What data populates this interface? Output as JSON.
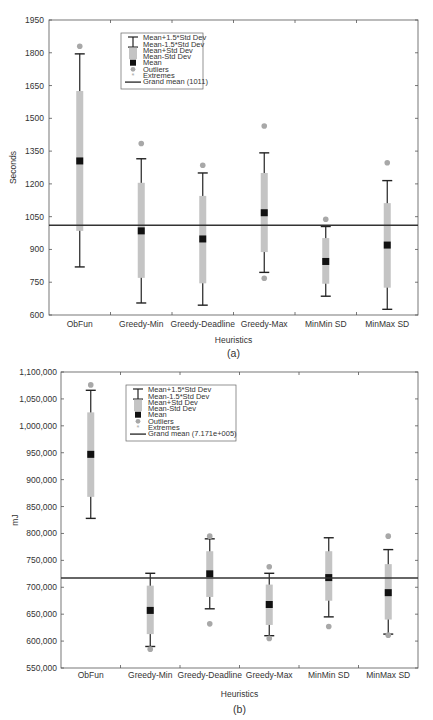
{
  "chart_data": [
    {
      "type": "box",
      "caption": "(a)",
      "xlabel": "Heuristics",
      "ylabel": "Seconds",
      "ylim": [
        600,
        1950
      ],
      "yticks": [
        600,
        750,
        900,
        1050,
        1200,
        1350,
        1500,
        1650,
        1800,
        1950
      ],
      "ytick_labels": [
        "600",
        "750",
        "900",
        "1050",
        "1200",
        "1350",
        "1500",
        "1650",
        "1800",
        "1950"
      ],
      "categories": [
        "ObFun",
        "Greedy-Min",
        "Greedy-Deadline",
        "Greedy-Max",
        "MinMin SD",
        "MinMax SD"
      ],
      "grand_mean": 1011,
      "series": [
        {
          "name": "ObFun",
          "mean": 1305,
          "box_low": 985,
          "box_high": 1625,
          "whisker_low": 820,
          "whisker_high": 1795,
          "outliers": [
            1830
          ]
        },
        {
          "name": "Greedy-Min",
          "mean": 985,
          "box_low": 770,
          "box_high": 1205,
          "whisker_low": 655,
          "whisker_high": 1315,
          "outliers": [
            1385
          ]
        },
        {
          "name": "Greedy-Deadline",
          "mean": 948,
          "box_low": 745,
          "box_high": 1145,
          "whisker_low": 645,
          "whisker_high": 1250,
          "outliers": [
            1285
          ]
        },
        {
          "name": "Greedy-Max",
          "mean": 1068,
          "box_low": 888,
          "box_high": 1250,
          "whisker_low": 795,
          "whisker_high": 1342,
          "outliers": [
            1465,
            768
          ]
        },
        {
          "name": "MinMin SD",
          "mean": 845,
          "box_low": 743,
          "box_high": 952,
          "whisker_low": 686,
          "whisker_high": 1005,
          "outliers": [
            1038
          ]
        },
        {
          "name": "MinMax SD",
          "mean": 920,
          "box_low": 725,
          "box_high": 1112,
          "whisker_low": 626,
          "whisker_high": 1215,
          "outliers": [
            1297
          ]
        }
      ],
      "legend": {
        "position": "upper center",
        "entries": [
          "Mean+1.5*Std Dev",
          "Mean-1.5*Std Dev",
          "Mean+Std Dev",
          "Mean-Std Dev",
          "Mean",
          "Outliers",
          "Extremes",
          "Grand mean (1011)"
        ]
      },
      "grid": false
    },
    {
      "type": "box",
      "caption": "(b)",
      "xlabel": "Heuristics",
      "ylabel": "mJ",
      "ylim": [
        550000,
        1100000
      ],
      "yticks": [
        550000,
        600000,
        650000,
        700000,
        750000,
        800000,
        850000,
        900000,
        950000,
        1000000,
        1050000,
        1100000
      ],
      "ytick_labels": [
        "550,000",
        "600,000",
        "650,000",
        "700,000",
        "750,000",
        "800,000",
        "850,000",
        "900,000",
        "950,000",
        "1,000,000",
        "1,050,000",
        "1,100,000"
      ],
      "categories": [
        "ObFun",
        "Greedy-Min",
        "Greedy-Deadline",
        "Greedy-Max",
        "MinMin SD",
        "MinMax SD"
      ],
      "grand_mean": 717100,
      "series": [
        {
          "name": "ObFun",
          "mean": 947000,
          "box_low": 868000,
          "box_high": 1025000,
          "whisker_low": 828000,
          "whisker_high": 1066000,
          "outliers": [
            1076000
          ]
        },
        {
          "name": "Greedy-Min",
          "mean": 657000,
          "box_low": 613000,
          "box_high": 703000,
          "whisker_low": 590000,
          "whisker_high": 726000,
          "outliers": [
            585000
          ]
        },
        {
          "name": "Greedy-Deadline",
          "mean": 725000,
          "box_low": 682000,
          "box_high": 767000,
          "whisker_low": 660000,
          "whisker_high": 790000,
          "outliers": [
            795000,
            632000
          ]
        },
        {
          "name": "Greedy-Max",
          "mean": 668000,
          "box_low": 630000,
          "box_high": 705000,
          "whisker_low": 610000,
          "whisker_high": 726000,
          "outliers": [
            738000,
            605000
          ]
        },
        {
          "name": "MinMin SD",
          "mean": 718000,
          "box_low": 675000,
          "box_high": 767000,
          "whisker_low": 645000,
          "whisker_high": 792000,
          "outliers": [
            627000
          ]
        },
        {
          "name": "MinMax SD",
          "mean": 690000,
          "box_low": 640000,
          "box_high": 743000,
          "whisker_low": 613000,
          "whisker_high": 770000,
          "outliers": [
            795000,
            611000
          ]
        }
      ],
      "legend": {
        "position": "upper center",
        "entries": [
          "Mean+1.5*Std Dev",
          "Mean-1.5*Std Dev",
          "Mean+Std Dev",
          "Mean-Std Dev",
          "Mean",
          "Outliers",
          "Extremes",
          "Grand mean (7.171e+005)"
        ]
      },
      "grid": false
    }
  ],
  "colors": {
    "box": "#c4c4c4",
    "whisker": "#222222",
    "mean": "#111111",
    "outlier": "#a8a8a8",
    "axis": "#555555",
    "grand_mean": "#333333"
  }
}
